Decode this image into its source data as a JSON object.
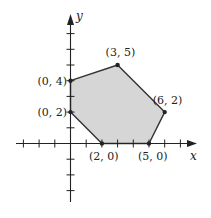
{
  "diagram": {
    "type": "feasible-region-polygon",
    "axes": {
      "x_label": "x",
      "y_label": "y",
      "x_ticks": [
        -3,
        -2,
        -1,
        1,
        2,
        3,
        4,
        5,
        6,
        7
      ],
      "y_ticks": [
        -3,
        -2,
        -1,
        1,
        2,
        3,
        4,
        5,
        6,
        7
      ],
      "x_range": [
        -3.5,
        8
      ],
      "y_range": [
        -3.7,
        8.2
      ]
    },
    "polygon": {
      "fill_color": "#d6d6d6",
      "stroke_color": "#333333",
      "vertices": [
        {
          "x": 0,
          "y": 2,
          "label": "(0, 2)"
        },
        {
          "x": 0,
          "y": 4,
          "label": "(0, 4)"
        },
        {
          "x": 3,
          "y": 5,
          "label": "(3, 5)"
        },
        {
          "x": 6,
          "y": 2,
          "label": "(6, 2)"
        },
        {
          "x": 5,
          "y": 0,
          "label": "(5, 0)"
        },
        {
          "x": 2,
          "y": 0,
          "label": "(2, 0)"
        }
      ]
    }
  }
}
